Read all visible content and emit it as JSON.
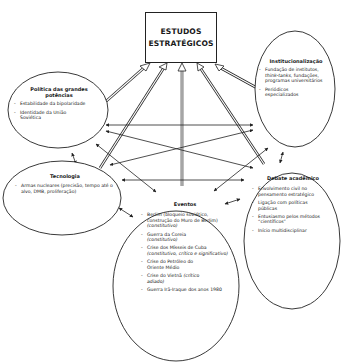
{
  "diagram": {
    "central": {
      "line1": "ESTUDOS",
      "line2": "ESTRATÉGICOS"
    },
    "nodes": {
      "politica": {
        "title": "Política das grandes potências",
        "items": [
          "Estabilidade da bipolaridade",
          "Identidade da União Soviética"
        ]
      },
      "institucionalizacao": {
        "title": "Institucionalização",
        "items": [
          {
            "pre": "Fundação de institutos, ",
            "em": "think-tanks",
            "post": ", fundações, programas universitários"
          },
          {
            "pre": "Periódicos especializados",
            "em": "",
            "post": ""
          }
        ]
      },
      "tecnologia": {
        "title": "Tecnologia",
        "items": [
          "Armas nucleares (precisão, tempo até o alvo, DMB, proliferação)"
        ]
      },
      "debate": {
        "title": "Debate acadêmico",
        "items": [
          "Envolvimento civil no pensamento estratégico",
          "Ligação com políticas públicas",
          "Entusiasmo pelos métodos “científicos”",
          "Início multidisciplinar"
        ]
      },
      "eventos": {
        "title": "Eventos",
        "items": [
          {
            "pre": "Berlim (bloqueio soviético, construção do Muro de Berlim) ",
            "em": "(constitutivo)",
            "post": ""
          },
          {
            "pre": "Guerra da Coreia ",
            "em": "(constitutivo)",
            "post": ""
          },
          {
            "pre": "Crise dos Mísseis de Cuba ",
            "em": "(constitutivo, crítico e significativo)",
            "post": ""
          },
          {
            "pre": "Crise do Petróleo do Oriente Médio",
            "em": "",
            "post": ""
          },
          {
            "pre": "Crise do Vietnã ",
            "em": "(crítico adiado)",
            "post": ""
          },
          {
            "pre": "Guerra Irã-Iraque dos anos 1980",
            "em": "",
            "post": ""
          }
        ]
      }
    },
    "colors": {
      "stroke": "#222222",
      "background": "#ffffff"
    }
  }
}
